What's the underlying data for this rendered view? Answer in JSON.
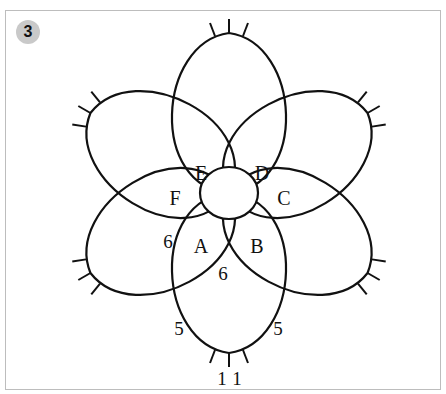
{
  "figure": {
    "step_number": "3",
    "loop_labels": {
      "A": "A",
      "B": "B",
      "C": "C",
      "D": "D",
      "E": "E",
      "F": "F"
    },
    "stitch_counts": {
      "a_outer": "6",
      "a_inner": "6",
      "bottom_left": "5",
      "bottom_right": "5",
      "tip_left": "1",
      "tip_right": "1"
    }
  },
  "colors": {
    "line": "#111111",
    "badge_bg": "#c9c9c9",
    "frame": "#bdbdbd"
  }
}
